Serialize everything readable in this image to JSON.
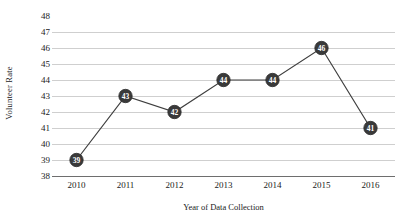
{
  "chart_data": {
    "type": "line",
    "title": "",
    "xlabel": "Year of Data Collection",
    "ylabel": "Volunteer Rate",
    "categories": [
      "2010",
      "2011",
      "2012",
      "2013",
      "2014",
      "2015",
      "2016"
    ],
    "values": [
      39,
      43,
      42,
      44,
      44,
      46,
      41
    ],
    "point_labels": [
      "39",
      "43",
      "42",
      "44",
      "44",
      "46",
      "41"
    ],
    "series": [
      {
        "name": "Volunteer Rate",
        "values": [
          39,
          43,
          42,
          44,
          44,
          46,
          41
        ]
      }
    ],
    "ylim": [
      38,
      48
    ],
    "yticks": [
      48,
      47,
      46,
      45,
      44,
      43,
      42,
      41,
      40,
      39,
      38
    ],
    "ytick_labels": [
      "48",
      "47",
      "46",
      "45",
      "44",
      "43",
      "42",
      "41",
      "40",
      "39",
      "38"
    ],
    "xtick_labels": [
      "2010",
      "2011",
      "2012",
      "2013",
      "2014",
      "2015",
      "2016"
    ],
    "grid": "horizontal",
    "legend": "none",
    "colors": {
      "marker": "#3a3a3a",
      "line": "#3f3f3f",
      "gridline": "#cfcfcf",
      "axis": "#6e6e6e",
      "text": "#1a1a1a",
      "marker_label": "#ffffff",
      "background": "#ffffff"
    }
  }
}
